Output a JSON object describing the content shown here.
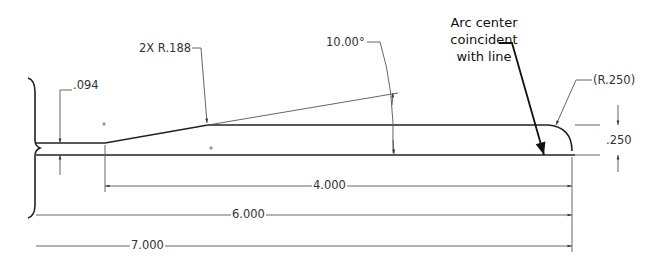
{
  "drawing": {
    "type": "engineering-drawing",
    "units": "inches",
    "dimensions": {
      "thickness_small": ".094",
      "fillet_radius": "2X R.188",
      "angle": "10.00°",
      "end_radius": "(R.250)",
      "thickness_end": ".250",
      "length_4": "4.000",
      "length_6": "6.000",
      "length_7": "7.000"
    },
    "note": {
      "line1": "Arc center",
      "line2": "coincident",
      "line3": "with line"
    },
    "colors": {
      "geometry": "#222222",
      "dimension": "#555555",
      "text": "#333333",
      "background": "#ffffff"
    }
  }
}
